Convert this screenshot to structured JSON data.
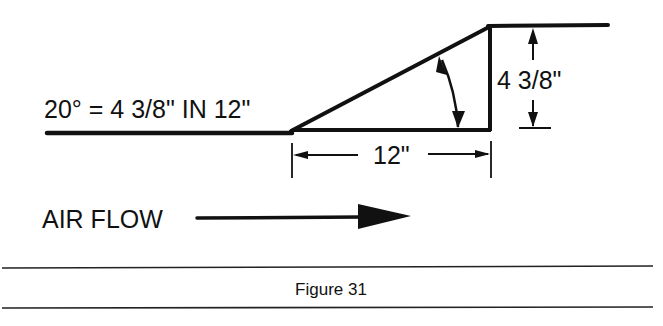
{
  "figure": {
    "caption": "Figure 31",
    "ratio_label": "20° = 4 3/8\" IN 12\"",
    "height_dimension": "4 3/8\"",
    "run_dimension": "12\"",
    "airflow_label": "AIR FLOW",
    "angle_degrees": 20,
    "colors": {
      "ink": "#111111",
      "background": "#ffffff"
    }
  }
}
